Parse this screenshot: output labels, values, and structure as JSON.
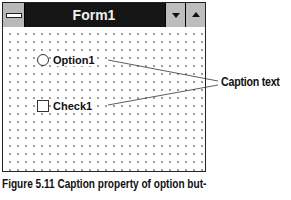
{
  "window": {
    "title": "Form1",
    "system_menu_icon": "system-menu-icon",
    "minimize_icon": "minimize-down-arrow-icon",
    "maximize_icon": "maximize-up-arrow-icon"
  },
  "form": {
    "controls": [
      {
        "type": "option-button",
        "caption": "Option1",
        "selected": false
      },
      {
        "type": "check-box",
        "caption": "Check1",
        "checked": false
      }
    ]
  },
  "annotation": {
    "callout_label": "Caption text",
    "line_color": "#333333"
  },
  "figure": {
    "caption": "Figure 5.11 Caption property of option but-"
  }
}
